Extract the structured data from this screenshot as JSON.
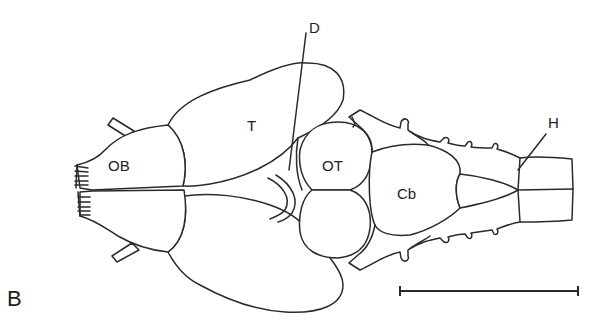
{
  "figure": {
    "panel_label": "B",
    "labels": {
      "olfactory_bulb": "OB",
      "telencephalon": "T",
      "diencephalon": "D",
      "optic_tectum": "OT",
      "cerebellum": "Cb",
      "hindbrain": "H"
    },
    "scale_bar": {
      "x1": 400,
      "x2": 578,
      "y": 291
    },
    "colors": {
      "line": "#2a2a2a",
      "background": "#ffffff",
      "text": "#222222"
    }
  }
}
